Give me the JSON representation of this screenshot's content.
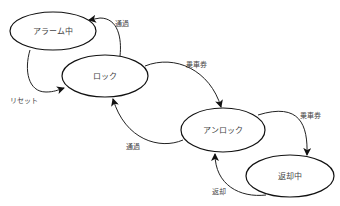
{
  "diagram": {
    "type": "state-machine",
    "colors": {
      "stroke": "#111111",
      "text": "#444444",
      "background": "#ffffff"
    },
    "states": [
      {
        "id": "alarm",
        "label": "アラーム中",
        "cx": 53,
        "cy": 31,
        "rx": 43,
        "ry": 19
      },
      {
        "id": "locked",
        "label": "ロック",
        "cx": 105,
        "cy": 76,
        "rx": 43,
        "ry": 21
      },
      {
        "id": "unlocked",
        "label": "アンロック",
        "cx": 223,
        "cy": 130,
        "rx": 42,
        "ry": 22
      },
      {
        "id": "returning",
        "label": "返却中",
        "cx": 290,
        "cy": 176,
        "rx": 44,
        "ry": 21
      }
    ],
    "transitions": [
      {
        "from": "locked",
        "to": "alarm",
        "label": "通過",
        "label_x": 122,
        "label_y": 24
      },
      {
        "from": "alarm",
        "to": "locked",
        "label": "リセット",
        "label_x": 24,
        "label_y": 101
      },
      {
        "from": "locked",
        "to": "unlocked",
        "label": "乗車券",
        "label_x": 196,
        "label_y": 65
      },
      {
        "from": "unlocked",
        "to": "locked",
        "label": "通過",
        "label_x": 133,
        "label_y": 147
      },
      {
        "from": "unlocked",
        "to": "returning",
        "label": "乗車券",
        "label_x": 310,
        "label_y": 116
      },
      {
        "from": "returning",
        "to": "unlocked",
        "label": "返却",
        "label_x": 219,
        "label_y": 192
      }
    ]
  }
}
